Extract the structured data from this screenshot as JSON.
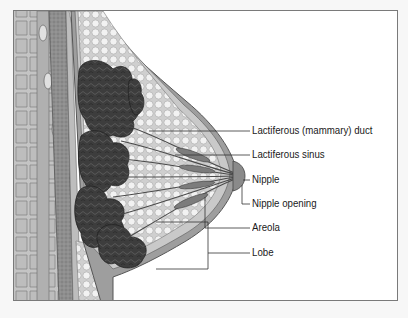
{
  "diagram": {
    "labels": [
      {
        "id": "lactiferous-duct",
        "text": "Lactiferous (mammary) duct",
        "y": 124
      },
      {
        "id": "lactiferous-sinus",
        "text": "Lactiferous sinus",
        "y": 148
      },
      {
        "id": "nipple",
        "text": "Nipple",
        "y": 173
      },
      {
        "id": "nipple-opening",
        "text": "Nipple opening",
        "y": 197
      },
      {
        "id": "areola",
        "text": "Areola",
        "y": 221
      },
      {
        "id": "lobe",
        "text": "Lobe",
        "y": 246
      }
    ],
    "colors": {
      "frame": "#7a7a7a",
      "leader_line": "#333333",
      "lobule": "#3a3a3a",
      "fat": "#e8e8e8",
      "skin": "#9a9a9a",
      "muscle": "#b5b5b5"
    }
  }
}
